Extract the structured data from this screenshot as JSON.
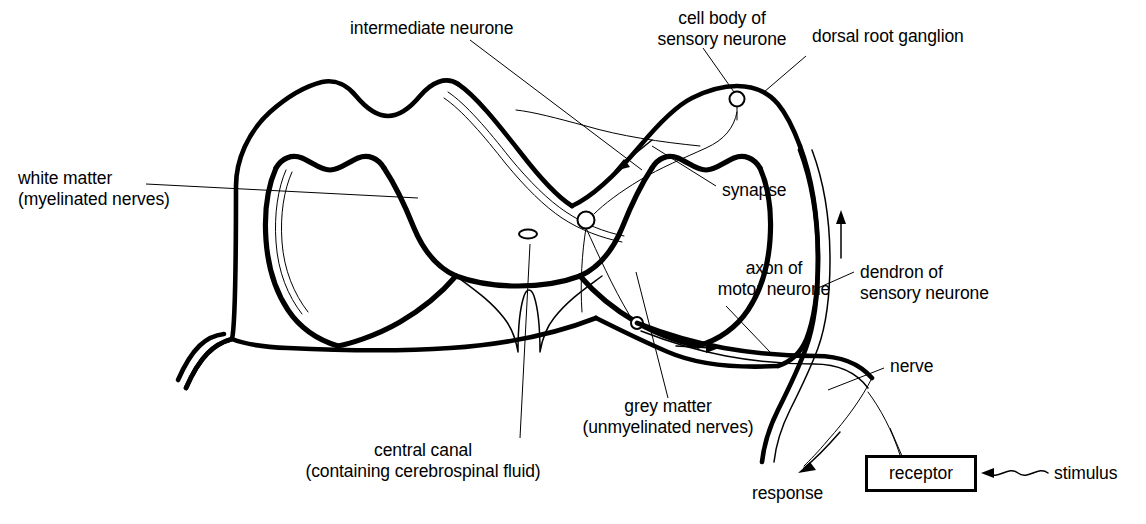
{
  "diagram": {
    "domain": "biology-diagram",
    "background_color": "#ffffff",
    "ink_color": "#000000",
    "labels": {
      "intermediate_neurone": "intermediate neurone",
      "cell_body_of_sensory_neurone_line1": "cell body of",
      "cell_body_of_sensory_neurone_line2": "sensory neurone",
      "dorsal_root_ganglion": "dorsal root ganglion",
      "white_matter_line1": "white matter",
      "white_matter_line2": "(myelinated nerves)",
      "synapse": "synapse",
      "axon_of_motor_neurone_line1": "axon of",
      "axon_of_motor_neurone_line2": "motor neurone",
      "dendron_of_sensory_neurone_line1": "dendron of",
      "dendron_of_sensory_neurone_line2": "sensory neurone",
      "nerve": "nerve",
      "grey_matter_line1": "grey matter",
      "grey_matter_line2": "(unmyelinated nerves)",
      "central_canal_line1": "central canal",
      "central_canal_line2": "(containing cerebrospinal fluid)",
      "response": "response",
      "receptor": "receptor",
      "stimulus": "stimulus"
    },
    "parts": [
      {
        "name": "white-matter-outline",
        "type": "outline",
        "stroke_width": 4.5
      },
      {
        "name": "grey-matter-butterfly",
        "type": "outline",
        "stroke_width": 4.5
      },
      {
        "name": "central-canal",
        "type": "ellipse",
        "cx": 528,
        "cy": 234,
        "rx": 9,
        "ry": 4.5
      },
      {
        "name": "dorsal-root-ganglion",
        "type": "bulge"
      },
      {
        "name": "sensory-neurone-cell-body",
        "type": "circle",
        "cx": 737,
        "cy": 99,
        "r": 7
      },
      {
        "name": "synapse-dorsal",
        "type": "circle",
        "cx": 586,
        "cy": 220,
        "r": 8
      },
      {
        "name": "synapse-ventral",
        "type": "circle",
        "cx": 637,
        "cy": 323,
        "r": 6
      },
      {
        "name": "receptor-box",
        "type": "rect",
        "x": 865,
        "y": 455,
        "w": 112,
        "h": 37
      }
    ],
    "flow_arrows": [
      {
        "name": "arrow-sensory-up",
        "direction": "up",
        "meaning": "impulse travelling up dendron of sensory neurone"
      },
      {
        "name": "arrow-intermediate-down-left",
        "direction": "down-left",
        "meaning": "impulse crossing through intermediate neurone"
      },
      {
        "name": "arrow-motor-right",
        "direction": "right",
        "meaning": "impulse travelling out along axon of motor neurone"
      },
      {
        "name": "arrow-response-out",
        "direction": "down-left",
        "meaning": "response to effector"
      },
      {
        "name": "arrow-stimulus-in",
        "direction": "left",
        "meaning": "stimulus entering receptor"
      }
    ]
  }
}
